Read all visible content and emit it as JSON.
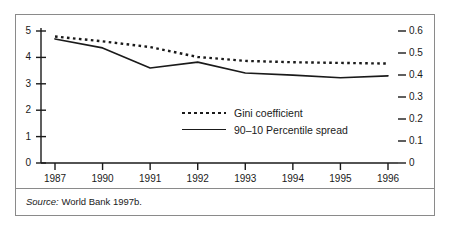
{
  "figure": {
    "background_color": "#ffffff",
    "border_color": "#8a8a8a",
    "ink_color": "#1a1a1a"
  },
  "source": {
    "keyword": "Source:",
    "text": " World Bank 1997b."
  },
  "chart_data": {
    "type": "line",
    "title": "",
    "subtitle": "",
    "xlabel": "",
    "ylabel": "",
    "grid": false,
    "legend_position": "center",
    "categories": [
      "1987",
      "1990",
      "1991",
      "1992",
      "1993",
      "1994",
      "1995",
      "1996"
    ],
    "x_tick_labels": [
      "1987",
      "1990",
      "1991",
      "1992",
      "1993",
      "1994",
      "1995",
      "1996"
    ],
    "axes": {
      "left": {
        "label": "",
        "ylim": [
          0,
          5
        ],
        "ticks": [
          0,
          1,
          2,
          3,
          4,
          5
        ],
        "tick_labels": [
          "0",
          "1",
          "2",
          "3",
          "4",
          "5"
        ]
      },
      "right": {
        "label": "",
        "ylim": [
          0,
          0.6
        ],
        "ticks": [
          0,
          0.1,
          0.2,
          0.3,
          0.4,
          0.5,
          0.6
        ],
        "tick_labels": [
          "0",
          "0.1",
          "0.2",
          "0.3",
          "0.4",
          "0.5",
          "0.6"
        ]
      }
    },
    "series": [
      {
        "name": "Gini coefficient",
        "style": "dotted",
        "axis": "right",
        "color": "#1a1a1a",
        "values": [
          0.575,
          0.553,
          0.527,
          0.482,
          0.464,
          0.458,
          0.455,
          0.452
        ]
      },
      {
        "name": "90–10 Percentile spread",
        "style": "solid",
        "axis": "left",
        "color": "#1a1a1a",
        "values": [
          4.7,
          4.36,
          3.6,
          3.82,
          3.41,
          3.33,
          3.23,
          3.3
        ]
      }
    ]
  }
}
